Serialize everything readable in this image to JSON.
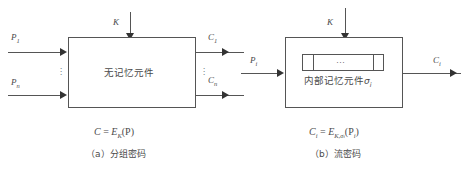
{
  "figure": {
    "background": "#ffffff",
    "line_color": "#555555",
    "text_color": "#4a4a4a"
  },
  "panel_a": {
    "box_label": "无记忆元件",
    "key_label": "K",
    "inputs": [
      {
        "label": "P",
        "sub": "1"
      },
      {
        "label": "P",
        "sub": "n"
      }
    ],
    "outputs": [
      {
        "label": "C",
        "sub": "1"
      },
      {
        "label": "C",
        "sub": "n"
      }
    ],
    "vertical_dots": "⋮",
    "formula": {
      "lhs": "C",
      "eq": "=",
      "rhs_base": "E",
      "rhs_sub": "K",
      "rhs_arg": "(P)"
    },
    "caption": "（a）分组密码"
  },
  "panel_b": {
    "box_label": "内部记忆元件",
    "box_label_sub_base": "σ",
    "box_label_sub": "i",
    "key_label": "K",
    "register": {
      "cells": [
        "",
        "…",
        ""
      ],
      "middle_dots": "···"
    },
    "input": {
      "label": "P",
      "sub": "i"
    },
    "output": {
      "label": "C",
      "sub": "i"
    },
    "formula": {
      "lhs_base": "C",
      "lhs_sub": "i",
      "eq": "=",
      "rhs_base": "E",
      "rhs_sub": "K,σ",
      "rhs_sub_sub": "i",
      "rhs_arg_base": "(P",
      "rhs_arg_sub": "i",
      "rhs_arg_close": ")"
    },
    "caption": "（b）流密码"
  }
}
